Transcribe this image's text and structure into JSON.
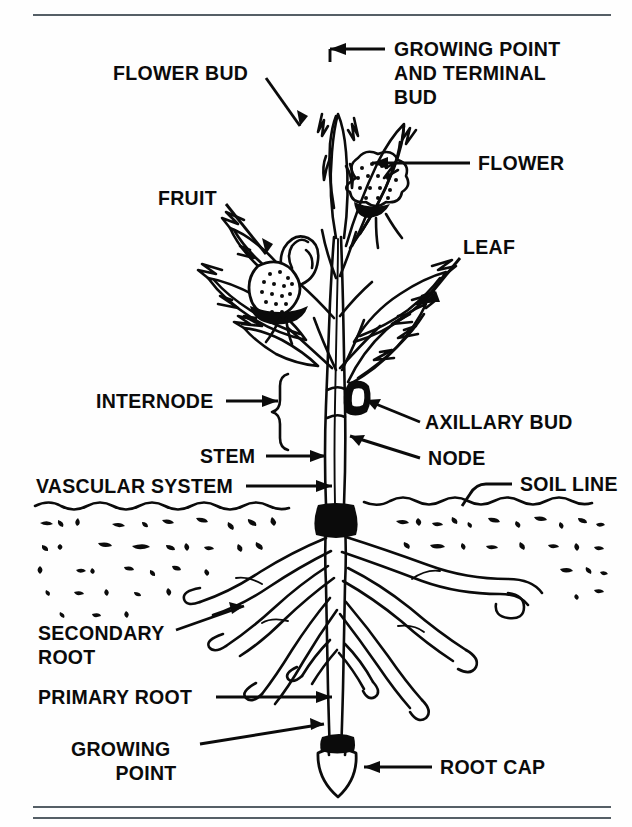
{
  "page": {
    "background_color": "#fefefe",
    "ink_color": "#0b0b0b",
    "rule_color": "#555f66",
    "cropped_header_text": "                                                                "
  },
  "figure": {
    "soil_line_y": 487
  },
  "labels": {
    "growing_point_terminal_bud": {
      "lines": [
        "GROWING POINT",
        "AND TERMINAL",
        "BUD"
      ],
      "line1": "GROWING POINT",
      "line2": "AND TERMINAL",
      "line3": "BUD",
      "align": "end",
      "points_to": "apex of shoot"
    },
    "flower": {
      "text": "FLOWER",
      "points_to": "flower cluster"
    },
    "flower_bud": {
      "text": "FLOWER BUD",
      "points_to": "unopened bud"
    },
    "fruit": {
      "text": "FRUIT",
      "points_to": "fruit body"
    },
    "leaf": {
      "text": "LEAF",
      "points_to": "leaf blade"
    },
    "internode": {
      "text": "INTERNODE",
      "points_to": "stem segment between nodes"
    },
    "axillary_bud": {
      "text": "AXILLARY BUD",
      "points_to": "bud in leaf axil"
    },
    "stem": {
      "text": "STEM",
      "points_to": "main stem"
    },
    "node": {
      "text": "NODE",
      "points_to": "stem node"
    },
    "vascular_system": {
      "text": "VASCULAR SYSTEM",
      "points_to": "stem vascular bundles"
    },
    "soil_line": {
      "text": "SOIL LINE",
      "points_to": "ground surface"
    },
    "secondary_root": {
      "lines": [
        "SECONDARY",
        "ROOT"
      ],
      "line1": "SECONDARY",
      "line2": "ROOT",
      "points_to": "lateral root"
    },
    "primary_root": {
      "text": "PRIMARY ROOT",
      "points_to": "taproot"
    },
    "growing_point_root": {
      "lines": [
        "GROWING",
        "POINT"
      ],
      "line1": "GROWING",
      "line2": "POINT",
      "points_to": "root tip meristem"
    },
    "root_cap": {
      "text": "ROOT CAP",
      "points_to": "root cap"
    }
  }
}
